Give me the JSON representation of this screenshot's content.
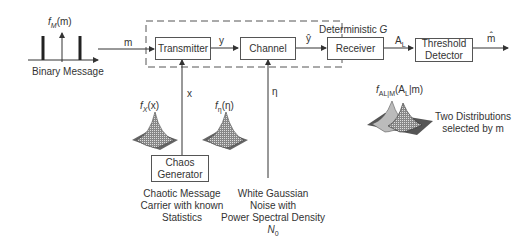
{
  "source": {
    "pdf_label": "f_M(m)",
    "pdf_label_main": "f",
    "pdf_label_sub": "M",
    "pdf_label_arg": "(m)",
    "caption": "Binary Message",
    "signal": "m"
  },
  "blocks": {
    "transmitter": "Transmitter",
    "channel": "Channel",
    "receiver": "Receiver",
    "threshold_detector_line1": "Threshold",
    "threshold_detector_line2": "Detector",
    "chaos_generator_line1": "Chaos",
    "chaos_generator_line2": "Generator"
  },
  "signals": {
    "y": "y",
    "y_hat": "ŷ",
    "a_l": "A",
    "a_l_sub": "L",
    "m_hat": "m̂",
    "x": "x",
    "eta": "η"
  },
  "deterministic_box": {
    "label": "Deterministic",
    "symbol": "G"
  },
  "distributions": {
    "fx_main": "f",
    "fx_sub": "X",
    "fx_arg": "(x)",
    "feta_main": "f",
    "feta_sub": "η",
    "feta_arg": "(η)",
    "fal_main": "f",
    "fal_sub": "A",
    "fal_subsub": "L",
    "fal_sub2": "|M",
    "fal_arg": "(A",
    "fal_arg_sub": "L",
    "fal_arg_end": "|m)"
  },
  "captions": {
    "chaos_line1": "Chaotic Message",
    "chaos_line2": "Carrier with known",
    "chaos_line3": "Statistics",
    "noise_line1": "White Gaussian",
    "noise_line2": "Noise with",
    "noise_line3": "Power Spectral Density",
    "noise_psd_main": "N",
    "noise_psd_sub": "0",
    "two_dist_line1": "Two Distributions",
    "two_dist_line2": "selected by m"
  }
}
